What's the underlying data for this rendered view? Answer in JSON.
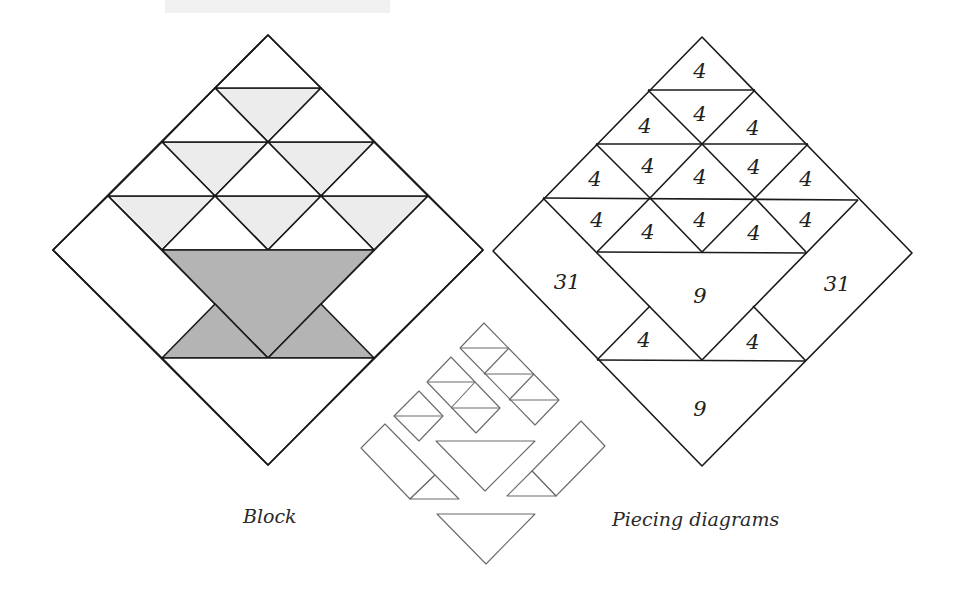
{
  "figure": {
    "captions": {
      "block": "Block",
      "piecing": "Piecing diagrams"
    },
    "colors": {
      "line": "#1a1a1a",
      "light_gray": "#ececec",
      "dark_gray": "#b4b4b4",
      "loose_piece_line": "#6a6a6a",
      "background": "#ffffff"
    },
    "block": {
      "description": "Basket block set on point: 9 light-gray downward triangles and 6 white upward triangles in a stacked triangle; dark-gray basket (large triangle plus two small triangles); white side rectangles and bottom triangle"
    },
    "piecing_diagram": {
      "labels": {
        "top_triangle": "4",
        "row2": [
          "4",
          "4",
          "4"
        ],
        "row3": [
          "4",
          "4",
          "4",
          "4",
          "4"
        ],
        "row4": [
          "4",
          "4",
          "4",
          "4",
          "4",
          "4"
        ],
        "left_rect": "31",
        "right_rect": "31",
        "basket_large": "9",
        "basket_small_left": "4",
        "basket_small_right": "4",
        "bottom_triangle": "9"
      }
    },
    "loose_pieces": {
      "description": "Exploded assembly: strips of 1, 2 and 3 half-square-triangle squares, large triangle, two rectangle-plus-triangle units, bottom triangle"
    }
  }
}
